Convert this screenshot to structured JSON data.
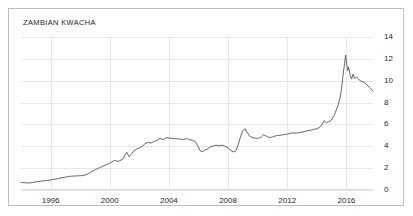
{
  "card": {
    "title": "ZAMBIAN KWACHA"
  },
  "chart_data": {
    "type": "line",
    "title": "ZAMBIAN KWACHA",
    "xlabel": "",
    "ylabel": "",
    "xlim": [
      1994.0,
      2017.8
    ],
    "ylim": [
      0,
      14
    ],
    "grid": true,
    "legend": "none",
    "line_color": "#555555",
    "grid_color": "#e4e8ee",
    "xticks": [
      1996,
      2000,
      2004,
      2008,
      2012,
      2016
    ],
    "xtick_labels": [
      "1996",
      "2000",
      "2004",
      "2008",
      "2012",
      "2016"
    ],
    "yticks": [
      0,
      2,
      4,
      6,
      8,
      10,
      12,
      14
    ],
    "ytick_labels": [
      "0",
      "2",
      "4",
      "6",
      "8",
      "10",
      "12",
      "14"
    ],
    "series": [
      {
        "name": "Zambian Kwacha",
        "x": [
          1994.0,
          1994.3,
          1994.6,
          1994.9,
          1995.2,
          1995.5,
          1995.8,
          1996.1,
          1996.4,
          1996.7,
          1997.0,
          1997.3,
          1997.6,
          1997.9,
          1998.2,
          1998.5,
          1998.8,
          1999.1,
          1999.4,
          1999.7,
          2000.0,
          2000.3,
          2000.6,
          2000.9,
          2001.0,
          2001.15,
          2001.3,
          2001.45,
          2001.6,
          2001.8,
          2002.0,
          2002.2,
          2002.4,
          2002.6,
          2002.8,
          2003.0,
          2003.2,
          2003.4,
          2003.6,
          2003.8,
          2004.0,
          2004.2,
          2004.4,
          2004.6,
          2004.8,
          2005.0,
          2005.2,
          2005.4,
          2005.6,
          2005.8,
          2005.95,
          2006.1,
          2006.25,
          2006.4,
          2006.6,
          2006.8,
          2007.0,
          2007.2,
          2007.4,
          2007.6,
          2007.8,
          2008.0,
          2008.2,
          2008.4,
          2008.55,
          2008.7,
          2008.85,
          2009.0,
          2009.15,
          2009.3,
          2009.45,
          2009.6,
          2009.8,
          2010.0,
          2010.2,
          2010.4,
          2010.6,
          2010.8,
          2011.0,
          2011.2,
          2011.4,
          2011.6,
          2011.8,
          2012.0,
          2012.2,
          2012.4,
          2012.6,
          2012.8,
          2013.0,
          2013.2,
          2013.4,
          2013.6,
          2013.8,
          2014.0,
          2014.2,
          2014.35,
          2014.5,
          2014.65,
          2014.8,
          2015.0,
          2015.15,
          2015.3,
          2015.45,
          2015.6,
          2015.7,
          2015.8,
          2015.88,
          2015.95,
          2016.0,
          2016.08,
          2016.15,
          2016.25,
          2016.35,
          2016.45,
          2016.55,
          2016.7,
          2016.85,
          2017.0,
          2017.2,
          2017.4,
          2017.6,
          2017.8
        ],
        "y": [
          0.7,
          0.66,
          0.64,
          0.72,
          0.78,
          0.83,
          0.88,
          0.95,
          1.02,
          1.1,
          1.18,
          1.25,
          1.28,
          1.3,
          1.32,
          1.45,
          1.7,
          1.9,
          2.1,
          2.28,
          2.45,
          2.7,
          2.62,
          2.85,
          3.15,
          3.45,
          3.05,
          3.25,
          3.55,
          3.75,
          3.85,
          4.0,
          4.25,
          4.35,
          4.3,
          4.45,
          4.55,
          4.72,
          4.6,
          4.78,
          4.75,
          4.72,
          4.7,
          4.68,
          4.65,
          4.62,
          4.7,
          4.6,
          4.55,
          4.4,
          4.05,
          3.62,
          3.5,
          3.62,
          3.75,
          3.95,
          4.02,
          4.1,
          4.05,
          4.1,
          4.0,
          3.85,
          3.6,
          3.48,
          3.62,
          4.2,
          4.9,
          5.45,
          5.6,
          5.25,
          4.95,
          4.82,
          4.75,
          4.72,
          4.8,
          5.05,
          4.92,
          4.8,
          4.85,
          4.95,
          5.0,
          5.02,
          5.08,
          5.12,
          5.18,
          5.22,
          5.2,
          5.25,
          5.3,
          5.38,
          5.42,
          5.48,
          5.55,
          5.6,
          5.75,
          6.0,
          6.35,
          6.15,
          6.25,
          6.4,
          6.75,
          7.25,
          7.8,
          8.6,
          9.6,
          10.8,
          11.6,
          12.35,
          11.85,
          10.9,
          11.25,
          10.55,
          10.15,
          10.6,
          10.2,
          10.35,
          10.1,
          9.95,
          9.85,
          9.6,
          9.35,
          9.05
        ]
      }
    ]
  }
}
